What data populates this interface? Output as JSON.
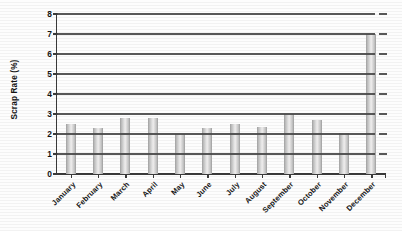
{
  "chart_data": {
    "type": "bar",
    "title": "",
    "xlabel": "",
    "ylabel": "Scrap Rate (%)",
    "ylim": [
      0,
      8
    ],
    "ytick_step": 1,
    "yticks": [
      "8",
      "7",
      "6",
      "5",
      "4",
      "3",
      "2",
      "1",
      "0"
    ],
    "grid": "horizontal",
    "legend": "none",
    "bar_color": "#d8d8d8",
    "axis_color": "#3a3a3a",
    "gridline_color": "#4a4a4a",
    "categories": [
      "January",
      "February",
      "March",
      "April",
      "May",
      "June",
      "July",
      "August",
      "September",
      "October",
      "November",
      "December"
    ],
    "values": [
      2.5,
      2.3,
      2.8,
      2.8,
      2.0,
      2.3,
      2.5,
      2.35,
      3.0,
      2.7,
      2.05,
      7.0
    ]
  }
}
